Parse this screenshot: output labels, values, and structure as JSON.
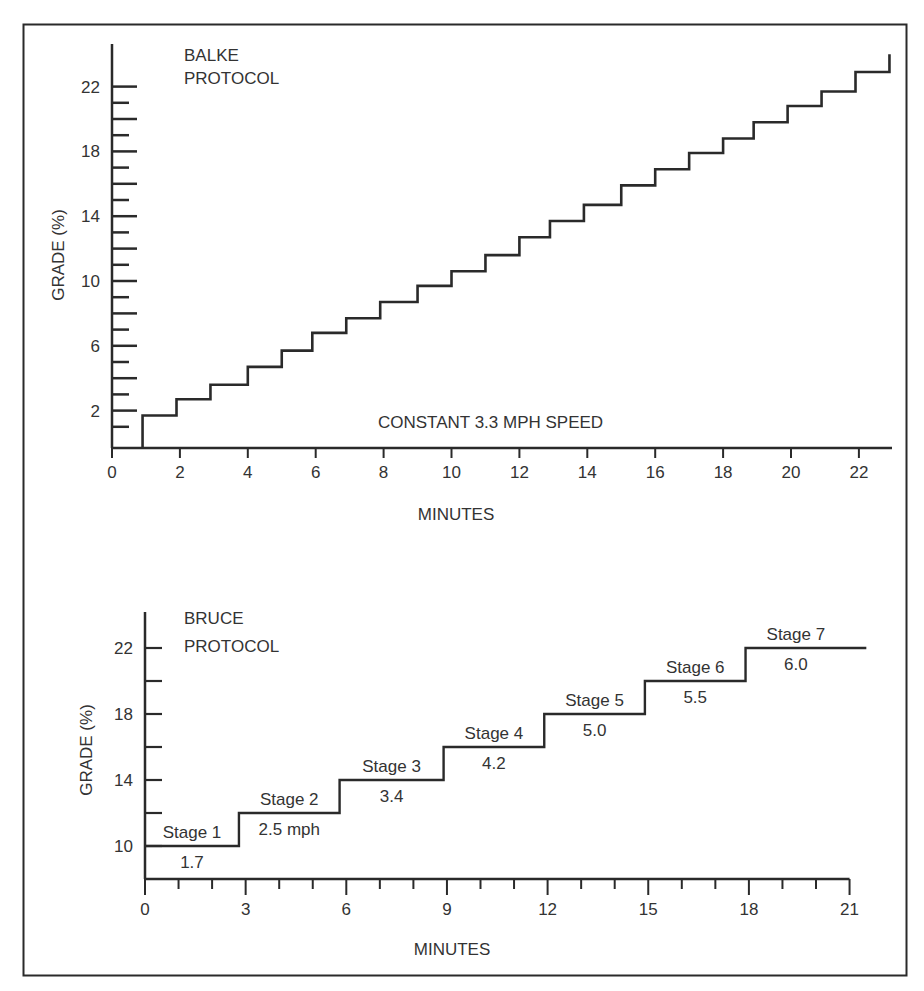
{
  "colors": {
    "ink": "#2a2a2a",
    "text": "#333333",
    "background": "#ffffff"
  },
  "chart_data": [
    {
      "type": "line",
      "step": true,
      "title": "BALKE\nPROTOCOL",
      "title_lines": [
        "BALKE",
        "PROTOCOL"
      ],
      "annotation": "CONSTANT 3.3 MPH SPEED",
      "xlabel": "MINUTES",
      "ylabel": "GRADE (%)",
      "xlim": [
        0,
        23
      ],
      "ylim": [
        0,
        24
      ],
      "xticks": [
        0,
        2,
        4,
        6,
        8,
        10,
        12,
        14,
        16,
        18,
        20,
        22
      ],
      "xtick_labels": [
        "0",
        "2",
        "4",
        "6",
        "8",
        "10",
        "12",
        "14",
        "16",
        "18",
        "20",
        "22"
      ],
      "yticks_major": [
        2,
        6,
        10,
        14,
        18,
        22
      ],
      "ytick_labels": [
        "2",
        "6",
        "10",
        "14",
        "18",
        "22"
      ],
      "yticks_minor": [
        1,
        3,
        4,
        5,
        7,
        8,
        9,
        11,
        12,
        13,
        15,
        16,
        17,
        19,
        20,
        21
      ],
      "grid": false,
      "legend": "none",
      "series": [
        {
          "name": "Grade",
          "x": [
            0.9,
            0.9,
            1.9,
            2.9,
            4.0,
            5.0,
            5.9,
            6.9,
            7.9,
            9.0,
            10.0,
            11.0,
            12.0,
            12.9,
            13.9,
            15.0,
            16.0,
            17.0,
            18.0,
            18.9,
            19.9,
            20.9,
            21.9,
            22.9
          ],
          "y": [
            0,
            1.7,
            2.7,
            3.6,
            4.7,
            5.7,
            6.8,
            7.7,
            8.7,
            9.7,
            10.6,
            11.6,
            12.7,
            13.7,
            14.7,
            15.9,
            16.9,
            17.9,
            18.8,
            19.8,
            20.8,
            21.7,
            22.9,
            24.0
          ]
        }
      ]
    },
    {
      "type": "line",
      "step": true,
      "title": "BRUCE\nPROTOCOL",
      "title_lines": [
        "BRUCE",
        "PROTOCOL"
      ],
      "xlabel": "MINUTES",
      "ylabel": "GRADE (%)",
      "xlim": [
        0,
        21
      ],
      "ylim": [
        8,
        24
      ],
      "xticks_major": [
        0,
        3,
        6,
        9,
        12,
        15,
        18,
        21
      ],
      "xtick_labels": [
        "0",
        "3",
        "6",
        "9",
        "12",
        "15",
        "18",
        "21"
      ],
      "xticks_minor": [
        1,
        2,
        4,
        5,
        7,
        8,
        10,
        11,
        13,
        14,
        16,
        17,
        19,
        20
      ],
      "yticks": [
        10,
        12,
        14,
        16,
        18,
        20,
        22
      ],
      "ytick_labels": [
        "10",
        "",
        "14",
        "",
        "18",
        "",
        "22"
      ],
      "grid": false,
      "legend": "none",
      "stages": [
        {
          "label": "Stage 1",
          "speed": "1.7",
          "start": 0,
          "end": 2.8,
          "grade": 10
        },
        {
          "label": "Stage 2",
          "speed": "2.5 mph",
          "start": 2.8,
          "end": 5.8,
          "grade": 12
        },
        {
          "label": "Stage 3",
          "speed": "3.4",
          "start": 5.8,
          "end": 8.9,
          "grade": 14
        },
        {
          "label": "Stage 4",
          "speed": "4.2",
          "start": 8.9,
          "end": 11.9,
          "grade": 16
        },
        {
          "label": "Stage 5",
          "speed": "5.0",
          "start": 11.9,
          "end": 14.9,
          "grade": 18
        },
        {
          "label": "Stage 6",
          "speed": "5.5",
          "start": 14.9,
          "end": 17.9,
          "grade": 20
        },
        {
          "label": "Stage 7",
          "speed": "6.0",
          "start": 17.9,
          "end": 21.5,
          "grade": 22
        }
      ]
    }
  ]
}
